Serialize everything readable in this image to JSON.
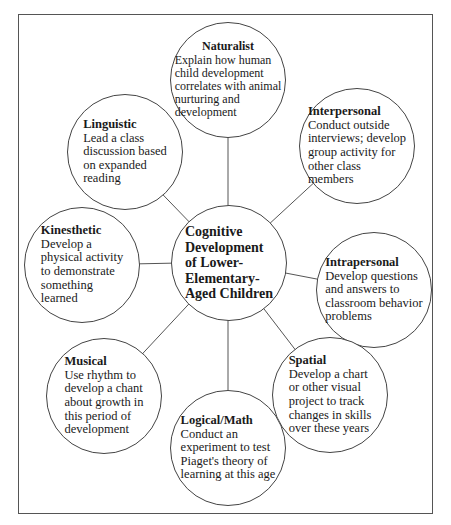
{
  "diagram": {
    "center": {
      "lines": [
        "Cognitive",
        "Development",
        "of Lower-",
        "Elementary-",
        "Aged Children"
      ]
    },
    "nodes": [
      {
        "title": "Naturalist",
        "lines": [
          "Explain how human",
          "child development",
          "correlates with animal",
          "nurturing and",
          "development"
        ]
      },
      {
        "title": "Interpersonal",
        "lines": [
          "Conduct outside",
          "interviews; develop",
          "group activity for",
          "other class",
          "members"
        ]
      },
      {
        "title": "Intrapersonal",
        "lines": [
          "Develop questions",
          "and answers to",
          "classroom behavior",
          "problems"
        ]
      },
      {
        "title": "Spatial",
        "lines": [
          "Develop a chart",
          "or other visual",
          "project to track",
          "changes in skills",
          "over these years"
        ]
      },
      {
        "title": "Logical/Math",
        "lines": [
          "Conduct an",
          "experiment to test",
          "Piaget's theory of",
          "learning at this age"
        ]
      },
      {
        "title": "Musical",
        "lines": [
          "Use rhythm to",
          "develop a chant",
          "about growth in",
          "this period of",
          "development"
        ]
      },
      {
        "title": "Kinesthetic",
        "lines": [
          "Develop a",
          "physical activity",
          "to demonstrate",
          "something",
          "learned"
        ]
      },
      {
        "title": "Linguistic",
        "lines": [
          "Lead a class",
          "discussion based",
          "on expanded",
          "reading"
        ]
      }
    ],
    "colors": {
      "stroke": "#444444",
      "background": "#ffffff",
      "text": "#1a1a1a"
    }
  }
}
